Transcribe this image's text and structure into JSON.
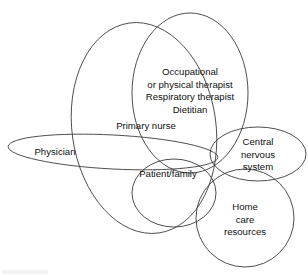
{
  "diagram": {
    "type": "venn",
    "background_color": "#ffffff",
    "stroke_color": "#3a3a3a",
    "text_color": "#111111",
    "nodes": [
      {
        "id": "therapists",
        "name": "therapists-ellipse",
        "shape": "ellipse",
        "cx": 190,
        "cy": 93,
        "rx": 58,
        "ry": 80,
        "rotation": 0,
        "lines": [
          "Occupational",
          "or physical therapist",
          "Respiratory therapist",
          "Dietitian"
        ],
        "label_x": 190,
        "label_y": 72,
        "line_height": 12.5
      },
      {
        "id": "primary_nurse",
        "name": "primary-nurse-ellipse",
        "shape": "ellipse",
        "cx": 144,
        "cy": 128,
        "rx": 72,
        "ry": 106,
        "rotation": -8,
        "lines": [
          "Primary nurse"
        ],
        "label_x": 146,
        "label_y": 126,
        "line_height": 12.5
      },
      {
        "id": "physician",
        "name": "physician-ellipse",
        "shape": "ellipse",
        "cx": 113,
        "cy": 152,
        "rx": 105,
        "ry": 17,
        "rotation": 3,
        "lines": [
          "Physician"
        ],
        "label_x": 55,
        "label_y": 152,
        "line_height": 12.5
      },
      {
        "id": "central_nervous_system",
        "name": "central-nervous-system-ellipse",
        "shape": "ellipse",
        "cx": 258,
        "cy": 154,
        "rx": 48,
        "ry": 27,
        "rotation": 0,
        "lines": [
          "Central",
          "nervous",
          "system"
        ],
        "label_x": 258,
        "label_y": 142,
        "line_height": 12.5
      },
      {
        "id": "patient_family",
        "name": "patient-family-ellipse",
        "shape": "ellipse",
        "cx": 174,
        "cy": 193,
        "rx": 42,
        "ry": 34,
        "rotation": 0,
        "lines": [
          "Patient/family"
        ],
        "label_x": 168,
        "label_y": 174,
        "line_height": 12.5
      },
      {
        "id": "home_care_resources",
        "name": "home-care-resources-ellipse",
        "shape": "ellipse",
        "cx": 245,
        "cy": 218,
        "rx": 49,
        "ry": 49,
        "rotation": 0,
        "lines": [
          "Home",
          "care",
          "resources"
        ],
        "label_x": 245,
        "label_y": 207,
        "line_height": 12.5
      }
    ]
  }
}
